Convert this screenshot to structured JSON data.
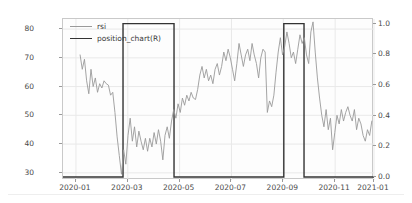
{
  "cell": {
    "prompt_label": "Out"
  },
  "chart_data": {
    "type": "line",
    "title": "",
    "xlabel": "",
    "ylabel": "",
    "grid": true,
    "legend_position": "upper-left",
    "x_tick_labels": [
      "2020-01",
      "2020-03",
      "2020-05",
      "2020-07",
      "2020-09",
      "2020-11",
      "2021-01"
    ],
    "x_tick_positions": [
      0.0417,
      0.2083,
      0.375,
      0.5417,
      0.7083,
      0.875,
      1.0
    ],
    "left_axis": {
      "label": "rsi",
      "ticks": [
        30,
        40,
        50,
        60,
        70,
        80
      ],
      "ylim": [
        27.5,
        83.5
      ]
    },
    "right_axis": {
      "label": "position_chart(R)",
      "ticks": [
        0.0,
        0.2,
        0.4,
        0.6,
        0.8,
        1.0
      ],
      "ylim": [
        -0.02,
        1.03
      ]
    },
    "series": [
      {
        "name": "rsi",
        "axis": "left",
        "color": "#9a9a9a",
        "linewidth": 0.9,
        "x": [
          0.055,
          0.062,
          0.069,
          0.076,
          0.083,
          0.09,
          0.097,
          0.104,
          0.111,
          0.118,
          0.125,
          0.132,
          0.139,
          0.146,
          0.153,
          0.16,
          0.167,
          0.174,
          0.181,
          0.188,
          0.195,
          0.202,
          0.209,
          0.216,
          0.223,
          0.23,
          0.237,
          0.244,
          0.251,
          0.258,
          0.265,
          0.272,
          0.279,
          0.286,
          0.293,
          0.3,
          0.307,
          0.314,
          0.321,
          0.328,
          0.335,
          0.342,
          0.349,
          0.356,
          0.363,
          0.37,
          0.377,
          0.384,
          0.391,
          0.398,
          0.405,
          0.412,
          0.419,
          0.426,
          0.433,
          0.44,
          0.447,
          0.454,
          0.461,
          0.468,
          0.475,
          0.482,
          0.489,
          0.496,
          0.503,
          0.51,
          0.517,
          0.524,
          0.531,
          0.538,
          0.545,
          0.552,
          0.559,
          0.566,
          0.573,
          0.58,
          0.587,
          0.594,
          0.601,
          0.608,
          0.615,
          0.622,
          0.629,
          0.636,
          0.643,
          0.65,
          0.657,
          0.664,
          0.671,
          0.678,
          0.685,
          0.692,
          0.699,
          0.706,
          0.713,
          0.72,
          0.727,
          0.734,
          0.741,
          0.748,
          0.755,
          0.762,
          0.769,
          0.776,
          0.783,
          0.79,
          0.797,
          0.804,
          0.811,
          0.818,
          0.825,
          0.832,
          0.839,
          0.846,
          0.853,
          0.86,
          0.867,
          0.874,
          0.881,
          0.888,
          0.895,
          0.902,
          0.909,
          0.916,
          0.923,
          0.93,
          0.937,
          0.944,
          0.951,
          0.958,
          0.965,
          0.972,
          0.979,
          0.986,
          0.993
        ],
        "y": [
          71.0,
          66.0,
          69.5,
          62.0,
          57.5,
          66.0,
          60.0,
          63.0,
          58.0,
          61.0,
          59.5,
          62.0,
          61.0,
          60.5,
          57.0,
          58.0,
          51.0,
          42.5,
          36.0,
          29.5,
          38.0,
          33.0,
          43.0,
          49.0,
          41.0,
          46.0,
          39.0,
          44.5,
          41.0,
          38.0,
          42.0,
          37.5,
          42.0,
          39.0,
          44.0,
          40.0,
          45.0,
          41.0,
          34.5,
          43.0,
          46.0,
          42.0,
          48.0,
          52.0,
          49.0,
          54.0,
          51.0,
          56.0,
          53.5,
          57.0,
          55.0,
          58.0,
          56.0,
          55.5,
          59.0,
          64.0,
          67.0,
          63.0,
          66.0,
          62.0,
          64.0,
          61.0,
          66.0,
          68.0,
          64.0,
          67.0,
          72.0,
          69.0,
          73.0,
          70.0,
          66.0,
          62.0,
          68.0,
          75.0,
          71.0,
          67.0,
          71.0,
          73.0,
          69.0,
          75.0,
          71.0,
          68.0,
          63.0,
          70.0,
          73.0,
          72.0,
          51.0,
          55.0,
          53.0,
          57.0,
          65.0,
          72.0,
          77.0,
          71.0,
          74.0,
          79.0,
          75.0,
          70.0,
          72.0,
          68.0,
          73.0,
          78.0,
          75.0,
          77.0,
          71.0,
          68.0,
          79.0,
          82.5,
          72.0,
          63.0,
          56.0,
          50.0,
          46.0,
          52.0,
          45.0,
          49.0,
          38.0,
          44.0,
          50.0,
          47.0,
          52.0,
          48.0,
          51.0,
          53.0,
          50.0,
          48.0,
          52.0,
          45.0,
          49.0,
          47.0,
          43.0,
          41.0,
          45.0,
          43.0,
          48.0
        ]
      },
      {
        "name": "position_chart(R)",
        "axis": "right",
        "color": "#333333",
        "linewidth": 1.4,
        "steps": [
          {
            "x_start": 0.0,
            "x_end": 0.193,
            "value": 0.0
          },
          {
            "x_start": 0.193,
            "x_end": 0.357,
            "value": 1.0
          },
          {
            "x_start": 0.357,
            "x_end": 0.71,
            "value": 0.0
          },
          {
            "x_start": 0.71,
            "x_end": 0.775,
            "value": 1.0
          },
          {
            "x_start": 0.775,
            "x_end": 1.0,
            "value": 0.0
          }
        ]
      }
    ],
    "legend_entries": [
      {
        "label": "rsi",
        "color": "#9a9a9a",
        "linewidth": 1
      },
      {
        "label": "position_chart(R)",
        "color": "#333333",
        "linewidth": 1.6
      }
    ]
  }
}
